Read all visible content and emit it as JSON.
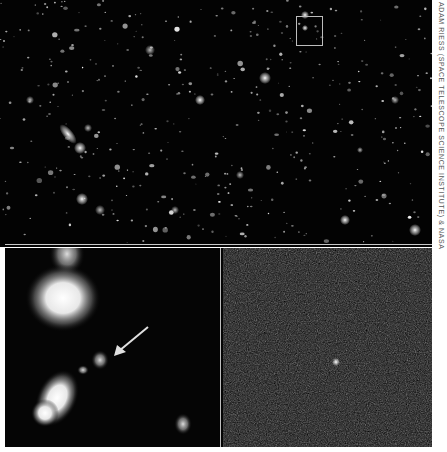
{
  "figure": {
    "credit": "ADAM RIESS (SPACE TELESCOPE SCIENCE INSTITUTE) & NASA",
    "panels": {
      "top": {
        "description": "Hubble deep field with many galaxies",
        "highlight_box": {
          "x": 296,
          "y": 16,
          "w": 25,
          "h": 28
        }
      },
      "bottom_left": {
        "description": "Zoomed view with arrow pointing to faint galaxy",
        "arrow": {
          "from": [
            148,
            327
          ],
          "to": [
            116,
            353
          ]
        }
      },
      "bottom_right": {
        "description": "Difference image showing point source (supernova)",
        "point_source": [
          336,
          362
        ]
      }
    },
    "colors": {
      "background": "#030303",
      "frame": "#ffffff",
      "lines": "#c8c8c8",
      "noise_panel": "#1a1a1a"
    }
  }
}
